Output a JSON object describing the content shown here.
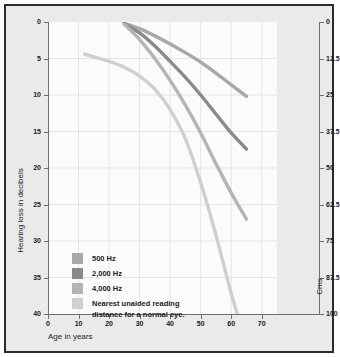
{
  "chart_data": {
    "type": "line",
    "title": "",
    "xlabel": "Age in years",
    "ylabel": "Hearing loss in decibels",
    "y2label": "Cms",
    "xlim": [
      0,
      75
    ],
    "ylim": [
      0,
      40
    ],
    "y2lim": [
      0,
      100
    ],
    "grid": true,
    "legend_position": "inside-bottom-left",
    "xticks": [
      "0",
      "10",
      "20",
      "30",
      "40",
      "50",
      "60",
      "70"
    ],
    "xtick_values": [
      0,
      10,
      20,
      30,
      40,
      50,
      60,
      70
    ],
    "yticks": [
      "0",
      "5",
      "10",
      "15",
      "20",
      "25",
      "30",
      "35",
      "40"
    ],
    "ytick_values": [
      0,
      5,
      10,
      15,
      20,
      25,
      30,
      35,
      40
    ],
    "y2ticks": [
      "0",
      "12.5",
      "25",
      "37.5",
      "50",
      "62.5",
      "75",
      "87.5",
      "100"
    ],
    "y2tick_values": [
      0,
      12.5,
      25,
      37.5,
      50,
      62.5,
      75,
      87.5,
      100
    ],
    "series": [
      {
        "name": "500 Hz",
        "color": "#a8a8a8",
        "axis": "left",
        "x": [
          25,
          30,
          35,
          40,
          45,
          50,
          55,
          60,
          65
        ],
        "values": [
          0.2,
          0.9,
          1.9,
          3.0,
          4.2,
          5.5,
          7.0,
          8.6,
          10.2
        ]
      },
      {
        "name": "2,000 Hz",
        "color": "#8a8a8a",
        "axis": "left",
        "x": [
          25,
          30,
          35,
          40,
          45,
          50,
          55,
          60,
          65
        ],
        "values": [
          0.2,
          1.5,
          3.3,
          5.4,
          7.6,
          10.0,
          12.6,
          15.2,
          17.4
        ]
      },
      {
        "name": "4,000 Hz",
        "color": "#b4b4b4",
        "axis": "left",
        "x": [
          25,
          30,
          35,
          40,
          45,
          50,
          55,
          60,
          65
        ],
        "values": [
          0.3,
          2.4,
          5.0,
          8.0,
          11.4,
          15.2,
          19.4,
          23.4,
          27.0
        ]
      },
      {
        "name": "Nearest unaided reading\ndistance for a normal eye.",
        "color": "#cfcfcf",
        "axis": "right",
        "x": [
          12,
          20,
          25,
          30,
          35,
          40,
          45,
          50,
          55,
          60,
          62
        ],
        "values": [
          11.0,
          13.5,
          15.5,
          18.5,
          23.0,
          30.0,
          40.0,
          55.0,
          73.0,
          93.0,
          100.0
        ]
      }
    ]
  },
  "legend": {
    "items": [
      {
        "label": "500 Hz",
        "color": "#a8a8a8"
      },
      {
        "label": "2,000 Hz",
        "color": "#8a8a8a"
      },
      {
        "label": "4,000 Hz",
        "color": "#b4b4b4"
      },
      {
        "label": "Nearest unaided reading\ndistance for a normal eye.",
        "color": "#cfcfcf"
      }
    ]
  }
}
